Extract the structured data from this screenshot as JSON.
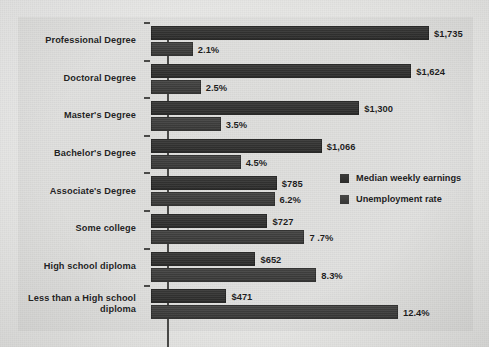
{
  "chart_data": {
    "type": "bar",
    "orientation": "horizontal",
    "title": "",
    "xlabel": "",
    "ylabel": "",
    "grid": false,
    "legend_position": "middle-right",
    "categories": [
      "Professional Degree",
      "Doctoral Degree",
      "Master's Degree",
      "Bachelor's Degree",
      "Associate's Degree",
      "Some college",
      "High school diploma",
      "Less than a High school diploma"
    ],
    "series": [
      {
        "name": "Median weekly earnings",
        "unit": "USD per week",
        "values": [
          1735,
          1624,
          1300,
          1066,
          785,
          727,
          652,
          471
        ],
        "labels": [
          "$1,735",
          "$1,624",
          "$1,300",
          "$1,066",
          "$785",
          "$727",
          "$652",
          "$471"
        ],
        "color": "#332f2e"
      },
      {
        "name": "Unemployment rate",
        "unit": "percent",
        "values": [
          2.1,
          2.5,
          3.5,
          4.5,
          6.2,
          7.7,
          8.3,
          12.4
        ],
        "labels": [
          "2.1%",
          "2.5%",
          "3.5%",
          "4.5%",
          "6.2%",
          "7 .7%",
          "8.3%",
          "12.4%"
        ],
        "color": "#3e3b3a"
      }
    ],
    "earnings_axis_max": 1735,
    "unemployment_axis_max": 12.4
  },
  "legend": {
    "items": [
      {
        "label": "Median weekly earnings"
      },
      {
        "label": "Unemployment rate"
      }
    ]
  }
}
